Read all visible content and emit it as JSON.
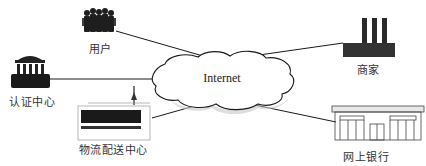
{
  "diagram": {
    "type": "network-topology",
    "center": {
      "label": "Internet",
      "shape": "cloud"
    },
    "nodes": [
      {
        "id": "users",
        "label": "用户",
        "icon": "people-icon"
      },
      {
        "id": "auth",
        "label": "认证中心",
        "icon": "building-icon"
      },
      {
        "id": "logistics",
        "label": "物流配送中心",
        "icon": "warehouse-icon"
      },
      {
        "id": "merchant",
        "label": "商家",
        "icon": "factory-icon"
      },
      {
        "id": "bank",
        "label": "网上银行",
        "icon": "bank-icon"
      }
    ],
    "edges": [
      {
        "from": "users",
        "to": "Internet"
      },
      {
        "from": "auth",
        "to": "Internet"
      },
      {
        "from": "logistics",
        "to": "Internet"
      },
      {
        "from": "merchant",
        "to": "Internet"
      },
      {
        "from": "bank",
        "to": "Internet"
      }
    ],
    "colors": {
      "line": "#1a1a1a",
      "icon": "#222222",
      "text": "#333333",
      "shadow": "#bdbdbd"
    }
  }
}
